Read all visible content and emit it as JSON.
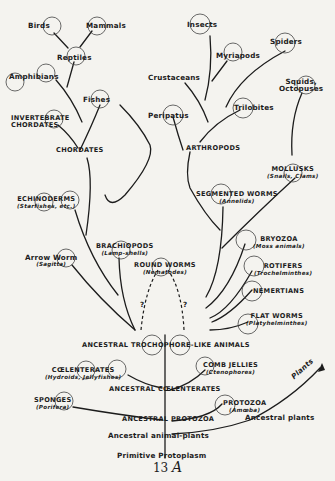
{
  "diagram": {
    "type": "evolutionary-tree",
    "page_number": "13",
    "page_letter": "A",
    "nodes": {
      "birds": {
        "label": "Birds"
      },
      "mammals": {
        "label": "Mammals"
      },
      "reptiles": {
        "label": "Reptiles"
      },
      "amphibians": {
        "label": "Amphibians"
      },
      "fishes": {
        "label": "Fishes"
      },
      "invertebrate_chordates": {
        "label_line1": "INVERTEBRATE",
        "label_line2": "CHORDATES"
      },
      "chordates": {
        "label": "CHORDATES"
      },
      "insects": {
        "label": "Insects"
      },
      "myriapods": {
        "label": "Myriapods"
      },
      "spiders": {
        "label": "Spiders"
      },
      "crustaceans": {
        "label": "Crustaceans"
      },
      "trilobites": {
        "label": "Trilobites"
      },
      "peripatus": {
        "label": "Peripatus"
      },
      "arthropods": {
        "label": "ARTHROPODS"
      },
      "squids": {
        "label_line1": "Squids,",
        "label_line2": "Octopuses"
      },
      "mollusks": {
        "label": "MOLLUSKS",
        "sub": "(Snails, Clams)"
      },
      "echinoderms": {
        "label": "ECHINODERMS",
        "sub": "(Starfishes, etc.)"
      },
      "segmented_worms": {
        "label": "SEGMENTED WORMS",
        "sub": "(Annelids)"
      },
      "brachiopods": {
        "label": "BRACHIOPODS",
        "sub": "(Lamp-shells)"
      },
      "bryozoa": {
        "label": "BRYOZOA",
        "sub": "(Moss animals)"
      },
      "arrow_worm": {
        "label": "Arrow Worm",
        "sub": "(Sagitta)"
      },
      "round_worms": {
        "label": "ROUND WORMS",
        "sub": "(Nematodes)"
      },
      "rotifers": {
        "label": "ROTIFERS",
        "sub": "(Trochelminthes)"
      },
      "nemertians": {
        "label": "NEMERTIANS"
      },
      "flat_worms": {
        "label": "FLAT WORMS",
        "sub": "(Platyhelminthes)"
      },
      "question_left": {
        "label": "?"
      },
      "question_right": {
        "label": "?"
      },
      "ancestral_trochophore": {
        "label": "ANCESTRAL TROCHOPHORE-LIKE ANIMALS"
      },
      "comb_jellies": {
        "label": "COMB JELLIES",
        "sub": "(Ctenophores)"
      },
      "coelenterates": {
        "label": "CŒLENTERATES",
        "sub": "(Hydroids, Jellyfishes)"
      },
      "ancestral_coelenterates": {
        "label": "ANCESTRAL CŒLENTERATES"
      },
      "sponges": {
        "label": "SPONGES",
        "sub": "(Porifera)"
      },
      "protozoa": {
        "label": "PROTOZOA",
        "sub": "(Amœba)"
      },
      "ancestral_protozoa": {
        "label": "ANCESTRAL PROTOZOA"
      },
      "plants": {
        "label": "Plants"
      },
      "ancestral_plants": {
        "label": "Ancestral plants"
      },
      "ancestral_animal_plants": {
        "label": "Ancestral animal-plants"
      },
      "primitive_protoplasm": {
        "label": "Primitive Protoplasm"
      }
    }
  }
}
